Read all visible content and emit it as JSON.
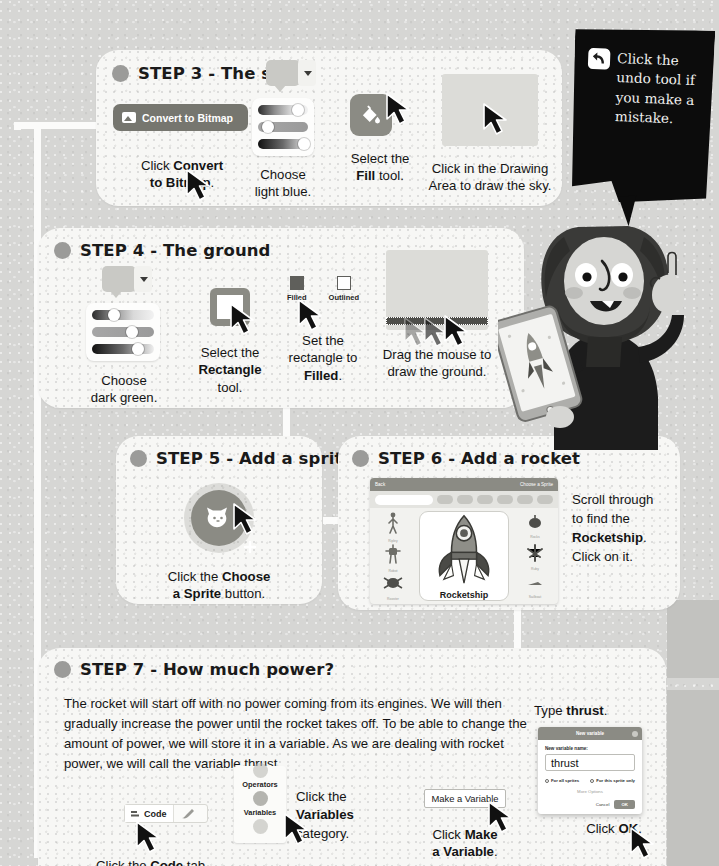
{
  "page": {
    "background_color": "#d6d6d4",
    "card_color": "#f7f7f5"
  },
  "speech_bubble": {
    "icon": "undo-icon",
    "text": "Click the undo tool if you make a mistake."
  },
  "character": {
    "name": "girl-with-tablet-illustration",
    "tablet_content": "rocket-launch-image"
  },
  "steps": [
    {
      "id": "step3",
      "number": "STEP 3",
      "separator": "-",
      "name": "The sky",
      "title": "STEP 3 - The sky",
      "items": [
        {
          "name": "convert-to-bitmap",
          "ui_label": "Convert to Bitmap",
          "caption_parts": [
            "Click ",
            "Convert to Bitmap",
            "."
          ],
          "caption": "Click Convert to Bitmap."
        },
        {
          "name": "color-sliders",
          "caption_parts": [
            "Choose light blue."
          ],
          "caption": "Choose light blue."
        },
        {
          "name": "fill-tool",
          "caption_parts": [
            "Select the ",
            "Fill",
            " tool."
          ],
          "caption": "Select the Fill tool."
        },
        {
          "name": "drawing-area",
          "caption_parts": [
            "Click in the Drawing Area to draw the sky."
          ],
          "caption": "Click in the Drawing Area to draw the sky."
        }
      ]
    },
    {
      "id": "step4",
      "number": "STEP 4",
      "separator": "-",
      "name": "The ground",
      "title": "STEP 4 - The ground",
      "items": [
        {
          "name": "color-sliders",
          "caption": "Choose dark green."
        },
        {
          "name": "rectangle-tool",
          "caption": "Select the Rectangle tool."
        },
        {
          "name": "fill-style-options",
          "option_filled": "Filled",
          "option_outlined": "Outlined",
          "caption": "Set the rectangle to Filled."
        },
        {
          "name": "drawing-area",
          "caption": "Drag the mouse to draw the ground."
        }
      ]
    },
    {
      "id": "step5",
      "number": "STEP 5",
      "separator": "-",
      "name": "Add a sprite",
      "title": "STEP 5 - Add a sprite",
      "items": [
        {
          "name": "choose-a-sprite-button",
          "caption": "Click the Choose a Sprite button."
        }
      ]
    },
    {
      "id": "step6",
      "number": "STEP 6",
      "separator": "-",
      "name": "Add a rocket",
      "title": "STEP 6 - Add a rocket",
      "library": {
        "back_label": "Back",
        "header_label": "Choose a Sprite",
        "search_placeholder": "Search",
        "selected_sprite": "Rocketship",
        "left_thumbs": [
          "Ripley",
          "Robot",
          "Rooster"
        ],
        "right_thumbs": [
          "Rocks",
          "Ruby",
          "Sailboat"
        ]
      },
      "caption": "Scroll through to find the Rocketship. Click on it."
    },
    {
      "id": "step7",
      "number": "STEP 7",
      "separator": "-",
      "name": "How much power?",
      "title": "STEP 7 - How much power?",
      "body": "The rocket will start off with no power coming from its engines. We will then gradually increase the power until the rocket takes off. To be able to change the amount of power, we will store it in a variable. As we are dealing with rocket power, we will call the variable thrust.",
      "items": [
        {
          "name": "code-tab",
          "ui_label": "Code",
          "caption": "Click the Code tab."
        },
        {
          "name": "variables-category",
          "category_above": "Operators",
          "category_selected": "Variables",
          "caption": "Click the Variables category."
        },
        {
          "name": "make-a-variable-button",
          "ui_label": "Make a Variable",
          "caption": "Click Make a Variable."
        },
        {
          "name": "new-variable-dialog",
          "caption_top": "Type thrust.",
          "caption_bottom": "Click OK.",
          "dialog": {
            "title": "New variable",
            "field_label": "New variable name:",
            "field_value": "thrust",
            "radio_all": "For all sprites",
            "radio_this": "For this sprite only",
            "more_options": "More Options",
            "cancel": "Cancel",
            "ok": "OK"
          }
        }
      ]
    }
  ]
}
